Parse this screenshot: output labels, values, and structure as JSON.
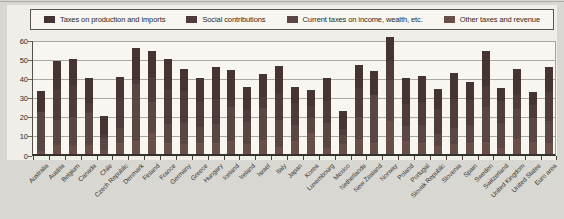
{
  "figure": {
    "page_background": "#d9d7d1",
    "panel_background": "#f7f6f1",
    "axis_color": "#35302c",
    "gridline_color": "#a9a8a2"
  },
  "chart_data": {
    "type": "bar",
    "stacked": true,
    "title": "",
    "xlabel": "",
    "ylabel": "",
    "ylim": [
      0,
      60
    ],
    "yticks": [
      0,
      10,
      20,
      30,
      40,
      50,
      60
    ],
    "grid": "horizontal",
    "legend_position": "top",
    "stack_order_bottom_to_top": [
      "Other taxes and revenue",
      "Current taxes on income, wealth, etc.",
      "Social contributions",
      "Taxes on production and imports"
    ],
    "categories": [
      "Australia",
      "Austria",
      "Belgium",
      "Canada",
      "Chile",
      "Czech Republic",
      "Denmark",
      "Finland",
      "France",
      "Germany",
      "Greece",
      "Hungary",
      "Iceland",
      "Ireland",
      "Israel",
      "Italy",
      "Japan",
      "Korea",
      "Luxembourg",
      "Mexico",
      "Netherlands",
      "New Zealand",
      "Norway",
      "Poland",
      "Portugal",
      "Slovak Republic",
      "Slovenia",
      "Spain",
      "Sweden",
      "Switzerland",
      "United Kingdom",
      "United States",
      "Euro area"
    ],
    "series": [
      {
        "name": "Taxes on production and imports",
        "color": "#463432",
        "values": [
          11,
          14.5,
          13.5,
          13,
          10,
          11,
          17,
          14,
          15.5,
          11.5,
          12.5,
          17,
          16,
          11.5,
          12.5,
          14,
          8.5,
          8.5,
          12,
          9.5,
          12,
          12.5,
          12.5,
          13.5,
          13.5,
          10.5,
          14,
          9.5,
          18.5,
          7,
          13,
          7,
          13
        ]
      },
      {
        "name": "Social contributions",
        "color": "#4f3c3a",
        "values": [
          0,
          16,
          16.5,
          5,
          1.5,
          15.5,
          2,
          13,
          18.5,
          17,
          13,
          13,
          3.5,
          7,
          5.5,
          14,
          11.5,
          6,
          11.5,
          3,
          15,
          0,
          10,
          11.5,
          12,
          13,
          15,
          13,
          11,
          11.5,
          8,
          6.5,
          15.5
        ]
      },
      {
        "name": "Current taxes on income, wealth, etc.",
        "color": "#5a4642",
        "values": [
          20.5,
          13.5,
          15.5,
          17,
          6.5,
          8,
          29.5,
          16,
          10,
          11,
          8,
          10,
          17.5,
          11.5,
          16.5,
          14.5,
          8,
          8,
          13,
          5,
          11.5,
          25,
          21.5,
          7.5,
          9.5,
          6.5,
          8.5,
          9.5,
          18,
          13,
          15.5,
          12.5,
          11.5
        ]
      },
      {
        "name": "Other taxes and revenue",
        "color": "#6a4e49",
        "values": [
          1.5,
          4.5,
          4,
          4.5,
          2,
          5.5,
          7,
          11,
          5.5,
          5,
          6,
          5.5,
          7,
          5,
          7.5,
          3.5,
          7,
          11,
          3,
          5,
          8,
          6,
          17,
          7,
          5.5,
          4,
          5,
          5.5,
          6.5,
          3,
          8,
          6.5,
          5.5
        ]
      }
    ],
    "totals": [
      33,
      48.5,
      49.5,
      39.5,
      20,
      40,
      55.5,
      54,
      49.5,
      44.5,
      39.5,
      45.5,
      44,
      35,
      42,
      46,
      35,
      33.5,
      39.5,
      22.5,
      46.5,
      43.5,
      61,
      39.5,
      40.5,
      34,
      42.5,
      37.5,
      54,
      34.5,
      44.5,
      32.5,
      45.5
    ]
  }
}
